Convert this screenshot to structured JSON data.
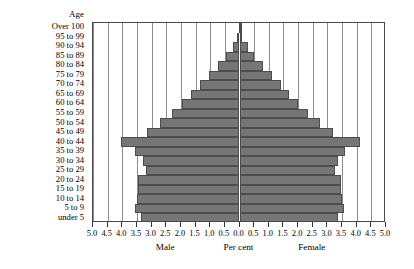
{
  "chart": {
    "y_axis_header": "Age",
    "x_axis_center_label": "Per cent",
    "left_group_label": "Male",
    "right_group_label": "Female",
    "bar_color": "#767676",
    "bar_border_color": "#4d4d4d",
    "grid_color": "#8c8c8c",
    "axis_color": "#4a4a4a"
  },
  "chart_data": {
    "type": "bar",
    "subtype": "population-pyramid",
    "title": "",
    "xlabel": "Per cent",
    "ylabel": "Age",
    "xlim": [
      -5.0,
      5.0
    ],
    "grid": true,
    "grid_step": 0.5,
    "legend_position": "none",
    "orientation": "horizontal",
    "categories": [
      "Over 100",
      "95 to 99",
      "90 to 94",
      "85 to 89",
      "80 to 84",
      "75 to 79",
      "70 to 74",
      "65 to 69",
      "60 to 64",
      "55 to 59",
      "50 to 54",
      "45 to 49",
      "40 to 44",
      "35 to 39",
      "30 to 34",
      "25 to 29",
      "20 to 24",
      "15 to 19",
      "10 to 14",
      "5 to 9",
      "under 5"
    ],
    "xtick_labels": [
      "5.0",
      "4.5",
      "4.0",
      "3.5",
      "3.0",
      "2.5",
      "2.0",
      "1.5",
      "1.0",
      "0.5",
      "0.0",
      "0.5",
      "1.0",
      "1.5",
      "2.0",
      "2.5",
      "3.0",
      "3.5",
      "4.0",
      "4.5",
      "5.0"
    ],
    "xtick_values": [
      -5.0,
      -4.5,
      -4.0,
      -3.5,
      -3.0,
      -2.5,
      -2.0,
      -1.5,
      -1.0,
      -0.5,
      0.0,
      0.5,
      1.0,
      1.5,
      2.0,
      2.5,
      3.0,
      3.5,
      4.0,
      4.5,
      5.0
    ],
    "series": [
      {
        "name": "Male",
        "side": "left",
        "values": [
          0.02,
          0.08,
          0.22,
          0.45,
          0.75,
          1.05,
          1.35,
          1.65,
          1.95,
          2.3,
          2.7,
          3.15,
          4.05,
          3.55,
          3.3,
          3.2,
          3.45,
          3.45,
          3.5,
          3.55,
          3.35
        ]
      },
      {
        "name": "Female",
        "side": "right",
        "values": [
          0.02,
          0.1,
          0.28,
          0.5,
          0.8,
          1.1,
          1.4,
          1.7,
          2.0,
          2.35,
          2.75,
          3.2,
          4.1,
          3.6,
          3.35,
          3.25,
          3.45,
          3.45,
          3.5,
          3.55,
          3.35
        ]
      }
    ]
  }
}
